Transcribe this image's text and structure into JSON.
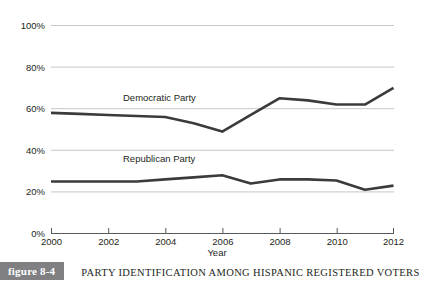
{
  "caption": {
    "badge": "figure 8-4",
    "title": "PARTY IDENTIFICATION AMONG HISPANIC REGISTERED VOTERS"
  },
  "chart_data": {
    "type": "line",
    "title": "PARTY IDENTIFICATION AMONG HISPANIC REGISTERED VOTERS",
    "xlabel": "Year",
    "ylabel": "",
    "xlim": [
      2000,
      2012
    ],
    "ylim": [
      0,
      100
    ],
    "grid": true,
    "legend_position": "inline-labels",
    "x_tick_labels": [
      "2000",
      "2002",
      "2004",
      "2006",
      "2008",
      "2010",
      "2012"
    ],
    "x_ticks": [
      2000,
      2002,
      2004,
      2006,
      2008,
      2010,
      2012
    ],
    "y_tick_labels": [
      "0%",
      "20%",
      "40%",
      "60%",
      "80%",
      "100%"
    ],
    "y_ticks": [
      0,
      20,
      40,
      60,
      80,
      100
    ],
    "x": [
      2000,
      2001,
      2002,
      2003,
      2004,
      2005,
      2006,
      2007,
      2008,
      2009,
      2010,
      2011,
      2012
    ],
    "series": [
      {
        "name": "Democratic Party",
        "label": "Democratic Party",
        "color": "#3b3b3d",
        "values": [
          58,
          57.5,
          57,
          56.5,
          56,
          53,
          49,
          57,
          65,
          64,
          62,
          62,
          70
        ]
      },
      {
        "name": "Republican Party",
        "label": "Republican Party",
        "color": "#3b3b3d",
        "values": [
          25,
          25,
          25,
          25,
          26,
          27,
          28,
          24,
          26,
          26,
          25.5,
          21,
          23
        ]
      }
    ],
    "annotations": [
      {
        "text": "Democratic Party",
        "x": 2003.0,
        "y": 63
      },
      {
        "text": "Republican Party",
        "x": 2003.0,
        "y": 34
      }
    ]
  }
}
